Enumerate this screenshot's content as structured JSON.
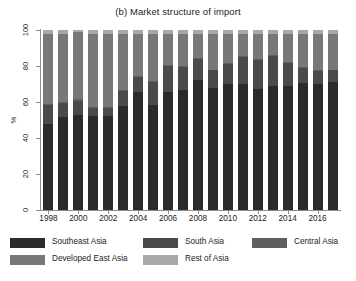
{
  "chart_data": {
    "type": "bar",
    "subtype": "stacked-percentage",
    "title": "(b) Market structure of import",
    "xlabel": "",
    "ylabel": "%",
    "ylim": [
      0,
      100
    ],
    "yticks": [
      0,
      20,
      40,
      60,
      80,
      100
    ],
    "grid": false,
    "legend_position": "bottom",
    "categories": [
      "1998",
      "1999",
      "2000",
      "2001",
      "2002",
      "2003",
      "2004",
      "2005",
      "2006",
      "2007",
      "2008",
      "2009",
      "2010",
      "2011",
      "2012",
      "2013",
      "2014",
      "2015",
      "2016",
      "2017"
    ],
    "xtick_labels": [
      "1998",
      "2000",
      "2002",
      "2004",
      "2006",
      "2008",
      "2010",
      "2012",
      "2014",
      "2016"
    ],
    "series": [
      {
        "name": "Southeast Asia",
        "color": "#2b2b2b",
        "values": [
          48,
          51.5,
          52.5,
          52,
          52,
          58,
          65.5,
          58.5,
          65.5,
          66.5,
          72,
          67.5,
          70,
          70,
          67,
          69,
          69,
          70.5,
          70,
          71
        ]
      },
      {
        "name": "South Asia",
        "color": "#4a4a4a",
        "values": [
          10.5,
          8,
          8,
          4.5,
          4.5,
          8,
          8.5,
          12.5,
          14.5,
          13,
          12,
          10,
          11,
          15,
          16.5,
          16.5,
          12.5,
          8.5,
          7,
          6.5
        ]
      },
      {
        "name": "Central Asia",
        "color": "#5f5f5f",
        "values": [
          0.5,
          0.5,
          1,
          0.5,
          0.5,
          0.5,
          0.5,
          0.5,
          0.5,
          0.5,
          0.5,
          0.5,
          0.5,
          0.5,
          0.5,
          0.5,
          0.5,
          0.5,
          0.5,
          0.5
        ]
      },
      {
        "name": "Developed East Asia",
        "color": "#787878",
        "values": [
          39,
          38,
          37.5,
          41,
          41,
          31.5,
          23.5,
          26.5,
          17.5,
          18,
          13.5,
          20,
          16.5,
          12.5,
          14,
          12,
          16,
          18.5,
          20.5,
          20
        ]
      },
      {
        "name": "Rest of Asia",
        "color": "#a8a8a8",
        "values": [
          2,
          2,
          1,
          2,
          2,
          2,
          2,
          2,
          2,
          2,
          2,
          2,
          2,
          2,
          2,
          2,
          2,
          2,
          2,
          2
        ]
      }
    ],
    "legend_entries": [
      {
        "label": "Southeast Asia",
        "color": "#2b2b2b"
      },
      {
        "label": "South Asia",
        "color": "#4a4a4a"
      },
      {
        "label": "Central Asia",
        "color": "#5f5f5f"
      },
      {
        "label": "Developed East Asia",
        "color": "#787878"
      },
      {
        "label": "Rest of Asia",
        "color": "#a8a8a8"
      }
    ]
  },
  "axis": {
    "y_title": "%",
    "y_labels": [
      "0",
      "20",
      "40",
      "60",
      "80",
      "100"
    ]
  },
  "colors": {
    "axis_line": "#8d8d8d",
    "text": "#1c1c1c",
    "background": "#ffffff"
  }
}
